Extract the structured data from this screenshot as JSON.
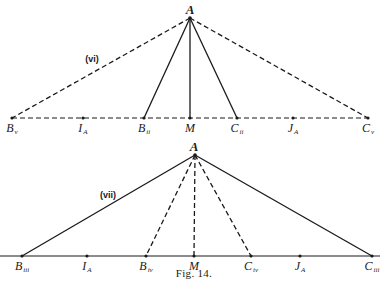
{
  "figure": {
    "caption": "Fig. 14.",
    "colors": {
      "ink": "#1a1a1a",
      "background": "#ffffff"
    }
  },
  "top_diagram": {
    "tag": "(vi)",
    "apex": {
      "label": "A",
      "x": 190,
      "y": 18
    },
    "baseline_y": 118,
    "baseline_style": "dashed",
    "points": [
      {
        "base": "B",
        "sub": "v",
        "x": 12
      },
      {
        "base": "I",
        "sub": "A",
        "x": 83
      },
      {
        "base": "B",
        "sub": "ii",
        "x": 144
      },
      {
        "base": "M",
        "sub": "",
        "x": 190
      },
      {
        "base": "C",
        "sub": "ii",
        "x": 237
      },
      {
        "base": "J",
        "sub": "A",
        "x": 293
      },
      {
        "base": "C",
        "sub": "v",
        "x": 368
      }
    ],
    "segments": [
      {
        "from": "A",
        "to": "Bv",
        "style": "dashed"
      },
      {
        "from": "A",
        "to": "Cv",
        "style": "dashed"
      },
      {
        "from": "A",
        "to": "Bii",
        "style": "solid"
      },
      {
        "from": "A",
        "to": "M",
        "style": "solid"
      },
      {
        "from": "A",
        "to": "Cii",
        "style": "solid"
      }
    ]
  },
  "bottom_diagram": {
    "tag": "(vii)",
    "apex": {
      "label": "A",
      "x": 195,
      "y": 155
    },
    "baseline_y": 256,
    "baseline_style": "solid",
    "points": [
      {
        "base": "B",
        "sub": "iii",
        "x": 22
      },
      {
        "base": "I",
        "sub": "A",
        "x": 87
      },
      {
        "base": "B",
        "sub": "iv",
        "x": 146
      },
      {
        "base": "M",
        "sub": "",
        "x": 194
      },
      {
        "base": "C",
        "sub": "iv",
        "x": 251
      },
      {
        "base": "J",
        "sub": "A",
        "x": 300
      },
      {
        "base": "C",
        "sub": "iii",
        "x": 372
      }
    ],
    "segments": [
      {
        "from": "A",
        "to": "Biii",
        "style": "solid"
      },
      {
        "from": "A",
        "to": "Ciii",
        "style": "solid"
      },
      {
        "from": "A",
        "to": "Biv",
        "style": "dashed"
      },
      {
        "from": "A",
        "to": "M",
        "style": "dashed"
      },
      {
        "from": "A",
        "to": "Civ",
        "style": "dashed"
      }
    ]
  }
}
